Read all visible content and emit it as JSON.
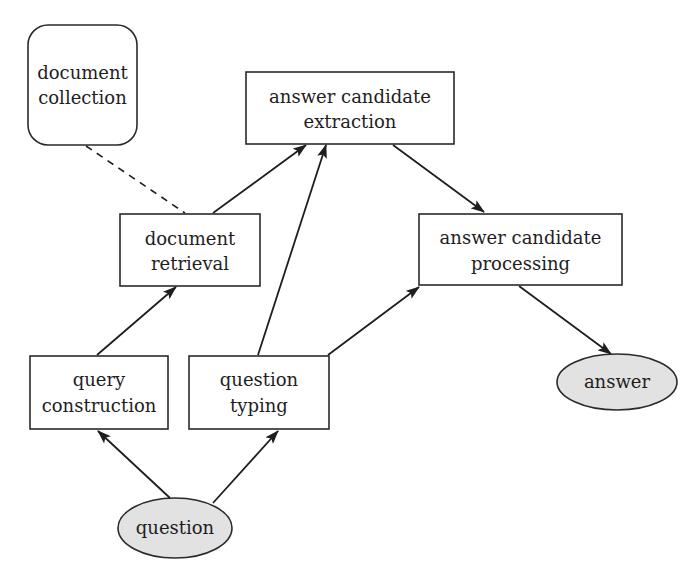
{
  "diagram": {
    "type": "flowchart",
    "nodes": {
      "document_collection": {
        "line1": "document",
        "line2": "collection",
        "shape": "rounded-rect"
      },
      "answer_candidate_extraction": {
        "line1": "answer candidate",
        "line2": "extraction",
        "shape": "rect"
      },
      "document_retrieval": {
        "line1": "document",
        "line2": "retrieval",
        "shape": "rect"
      },
      "answer_candidate_processing": {
        "line1": "answer candidate",
        "line2": "processing",
        "shape": "rect"
      },
      "query_construction": {
        "line1": "query",
        "line2": "construction",
        "shape": "rect"
      },
      "question_typing": {
        "line1": "question",
        "line2": "typing",
        "shape": "rect"
      },
      "question": {
        "label": "question",
        "shape": "ellipse"
      },
      "answer": {
        "label": "answer",
        "shape": "ellipse"
      }
    },
    "edges": [
      {
        "from": "document_collection",
        "to": "document_retrieval",
        "style": "dashed",
        "directed": false
      },
      {
        "from": "question",
        "to": "query_construction",
        "style": "solid",
        "directed": true
      },
      {
        "from": "question",
        "to": "question_typing",
        "style": "solid",
        "directed": true
      },
      {
        "from": "query_construction",
        "to": "document_retrieval",
        "style": "solid",
        "directed": true
      },
      {
        "from": "document_retrieval",
        "to": "answer_candidate_extraction",
        "style": "solid",
        "directed": true
      },
      {
        "from": "question_typing",
        "to": "answer_candidate_extraction",
        "style": "solid",
        "directed": true
      },
      {
        "from": "question_typing",
        "to": "answer_candidate_processing",
        "style": "solid",
        "directed": true
      },
      {
        "from": "answer_candidate_extraction",
        "to": "answer_candidate_processing",
        "style": "solid",
        "directed": true
      },
      {
        "from": "answer_candidate_processing",
        "to": "answer",
        "style": "solid",
        "directed": true
      }
    ],
    "colors": {
      "ellipse_fill": "#e2e2e2",
      "box_fill": "#ffffff",
      "stroke": "#2a2a2a"
    }
  }
}
